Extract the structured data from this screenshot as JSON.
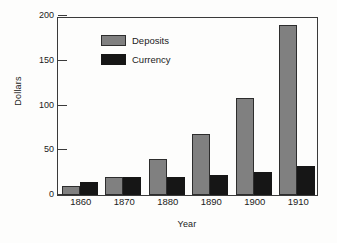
{
  "chart_data": {
    "type": "bar",
    "title": "",
    "xlabel": "Year",
    "ylabel": "Dollars",
    "categories": [
      "1860",
      "1870",
      "1880",
      "1890",
      "1900",
      "1910"
    ],
    "series": [
      {
        "name": "Deposits",
        "color": "#808080",
        "values": [
          10,
          20,
          40,
          68,
          108,
          190
        ]
      },
      {
        "name": "Currency",
        "color": "#161616",
        "values": [
          15,
          20,
          20,
          22,
          26,
          32
        ]
      }
    ],
    "ylim": [
      0,
      200
    ],
    "yticks": [
      0,
      50,
      100,
      150,
      200
    ],
    "ytick_labels": [
      "0",
      "50",
      "100",
      "150",
      "200"
    ],
    "grid": false,
    "legend_position": "upper-left-inside",
    "frame": true,
    "background": "#fdfdfc"
  }
}
